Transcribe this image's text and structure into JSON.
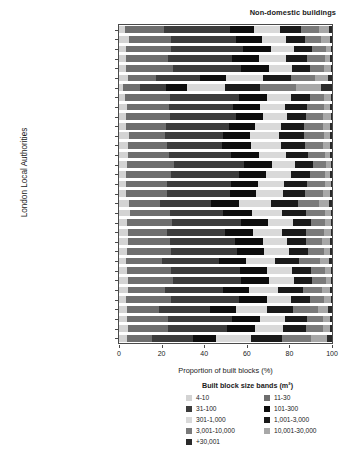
{
  "chart_data": {
    "type": "bar",
    "subtype": "stacked-horizontal-100pct",
    "title": "Non-domestic buildings",
    "xlabel": "Proportion of built blocks (%)",
    "ylabel": "London Local Authorities",
    "xlim": [
      0,
      100
    ],
    "xticks": [
      0,
      20,
      40,
      60,
      80,
      100
    ],
    "grid": false,
    "legend_position": "below-plot",
    "legend_title": "Built block size bands (m²)",
    "categories": [
      "Barking and Dagenham",
      "Barnet",
      "Bexley",
      "Brent",
      "Bromley",
      "Camden",
      "City of London",
      "Croydon",
      "Ealing",
      "Enfield",
      "Greenwich",
      "Hackney",
      "Hammersmith and Fulham",
      "Haringey",
      "Harrow",
      "Havering",
      "Hillingdon",
      "Hounslow",
      "Islington",
      "Kensington and Chelsea",
      "Kingston upon Thames",
      "Lambeth",
      "Lewisham",
      "Merton",
      "Newham",
      "Redbridge",
      "Richmond upon Thames",
      "Southwark",
      "Sutton",
      "Tower Hamlets",
      "Waltham Forest",
      "Wandsworth",
      "Westminster"
    ],
    "series": [
      {
        "name": "4-10",
        "color": "#d3d3d3",
        "values": [
          3.0,
          4.5,
          3.2,
          3.5,
          3.4,
          4.2,
          2.0,
          3.0,
          3.6,
          3.4,
          3.2,
          4.6,
          4.4,
          4.2,
          3.8,
          3.2,
          3.2,
          3.5,
          4.6,
          5.0,
          3.6,
          4.4,
          4.0,
          3.8,
          3.4,
          3.6,
          4.0,
          4.2,
          3.4,
          3.8,
          3.6,
          4.4,
          3.6
        ]
      },
      {
        "name": "11-30",
        "color": "#6e6e6e",
        "values": [
          18.0,
          20.0,
          21.0,
          19.5,
          22.0,
          13.0,
          8.0,
          21.0,
          20.0,
          20.5,
          19.0,
          17.0,
          18.0,
          19.5,
          22.0,
          21.0,
          19.5,
          19.0,
          15.0,
          19.0,
          21.5,
          18.0,
          20.0,
          20.5,
          17.0,
          21.0,
          21.5,
          17.5,
          21.0,
          15.0,
          19.5,
          18.5,
          12.0
        ]
      },
      {
        "name": "31-100",
        "color": "#3c3c3c",
        "values": [
          31.0,
          30.5,
          34.0,
          30.0,
          32.0,
          21.0,
          12.0,
          32.5,
          30.0,
          31.0,
          29.5,
          27.0,
          26.0,
          29.0,
          33.0,
          32.0,
          30.0,
          29.5,
          24.0,
          25.0,
          32.0,
          27.5,
          30.5,
          31.0,
          27.0,
          32.0,
          32.0,
          27.0,
          32.0,
          24.0,
          30.0,
          28.0,
          19.0
        ]
      },
      {
        "name": "101-300",
        "color": "#0d0d0d",
        "values": [
          11.5,
          12.0,
          13.0,
          12.5,
          13.0,
          12.0,
          10.0,
          13.0,
          12.5,
          12.5,
          12.0,
          13.0,
          13.5,
          13.0,
          13.0,
          13.0,
          12.5,
          12.5,
          13.0,
          13.5,
          13.0,
          13.0,
          13.0,
          13.0,
          12.5,
          13.0,
          13.0,
          12.5,
          13.0,
          12.0,
          13.0,
          13.0,
          11.0
        ]
      },
      {
        "name": "301-1,000",
        "color": "#d9d9d9",
        "values": [
          12.0,
          11.5,
          11.0,
          13.0,
          11.0,
          17.5,
          18.0,
          11.5,
          12.0,
          11.5,
          12.5,
          13.5,
          14.0,
          12.5,
          11.0,
          11.5,
          12.5,
          12.5,
          15.0,
          14.0,
          11.5,
          13.5,
          11.5,
          11.5,
          13.5,
          11.5,
          11.5,
          13.5,
          11.5,
          14.5,
          12.0,
          13.0,
          16.5
        ]
      },
      {
        "name": "1,001-3,000",
        "color": "#1a1a1a",
        "values": [
          10.0,
          9.0,
          8.5,
          10.0,
          8.5,
          13.0,
          16.0,
          8.5,
          10.0,
          9.0,
          10.5,
          12.0,
          11.5,
          10.5,
          8.5,
          9.0,
          10.5,
          10.5,
          13.0,
          11.5,
          8.5,
          11.5,
          9.0,
          9.0,
          11.5,
          9.0,
          8.5,
          11.5,
          9.0,
          12.5,
          10.0,
          11.0,
          14.5
        ]
      },
      {
        "name": "3,001-10,000",
        "color": "#7a7a7a",
        "values": [
          8.5,
          7.5,
          6.5,
          8.0,
          6.5,
          11.5,
          17.0,
          7.0,
          8.0,
          8.0,
          9.0,
          9.0,
          8.5,
          8.0,
          6.0,
          7.0,
          8.5,
          8.5,
          10.0,
          8.5,
          6.5,
          8.5,
          7.5,
          7.5,
          10.0,
          6.5,
          6.5,
          9.0,
          6.5,
          11.5,
          7.5,
          8.0,
          13.5
        ]
      },
      {
        "name": "10,001-30,000",
        "color": "#a8a8a8",
        "values": [
          4.5,
          4.0,
          2.3,
          2.8,
          3.0,
          6.0,
          12.0,
          3.0,
          3.2,
          3.5,
          3.6,
          3.2,
          3.3,
          2.6,
          2.2,
          2.6,
          3.0,
          3.3,
          4.6,
          3.0,
          2.8,
          3.0,
          3.8,
          2.9,
          4.4,
          2.8,
          2.4,
          4.0,
          3.0,
          5.0,
          3.6,
          3.4,
          7.5
        ]
      },
      {
        "name": "+30,001",
        "color": "#2a2a2a",
        "values": [
          1.5,
          1.0,
          0.5,
          0.7,
          0.6,
          1.8,
          5.0,
          0.5,
          0.7,
          0.6,
          0.7,
          0.7,
          0.8,
          0.7,
          0.5,
          0.7,
          0.3,
          0.7,
          1.4,
          0.5,
          0.6,
          0.6,
          0.7,
          0.8,
          1.2,
          0.6,
          0.6,
          0.8,
          0.6,
          1.7,
          0.8,
          0.7,
          2.4
        ]
      }
    ]
  },
  "legend": {
    "title": "Built block size bands (m²)",
    "columns": [
      [
        {
          "label": "4-10",
          "color": "#d3d3d3"
        },
        {
          "label": "31-100",
          "color": "#3c3c3c"
        },
        {
          "label": "301-1,000",
          "color": "#d9d9d9"
        },
        {
          "label": "3,001-10,000",
          "color": "#7a7a7a"
        },
        {
          "label": "+30,001",
          "color": "#2a2a2a"
        }
      ],
      [
        {
          "label": "11-30",
          "color": "#6e6e6e"
        },
        {
          "label": "101-300",
          "color": "#0d0d0d"
        },
        {
          "label": "1,001-3,000",
          "color": "#1a1a1a"
        },
        {
          "label": "10,001-30,000",
          "color": "#a8a8a8"
        }
      ]
    ]
  }
}
